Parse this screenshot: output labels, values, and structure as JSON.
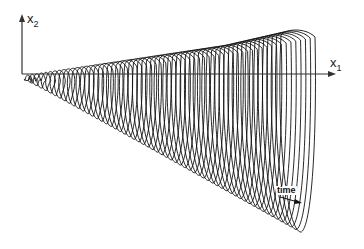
{
  "chart_data": {
    "type": "line",
    "title": "",
    "xlabel": "x1",
    "ylabel": "x2",
    "annotations": [
      {
        "text": "time",
        "arrow": "toward right/down along trajectory sweep"
      }
    ],
    "axes": {
      "origin_px": [
        22,
        74
      ],
      "x_axis_end_px": [
        330,
        74
      ],
      "y_axis_end_px": [
        22,
        16
      ]
    },
    "series": [
      {
        "name": "trajectory loops",
        "loop_count": 60,
        "crest_1_px": [
          248,
          34
        ],
        "crest_2_px": [
          318,
          34
        ],
        "lowest_point_px": [
          292,
          236
        ]
      }
    ],
    "grid": false,
    "legend": null
  },
  "labels": {
    "x_axis": {
      "base": "x",
      "sub": "1"
    },
    "y_axis": {
      "base": "x",
      "sub": "2"
    },
    "time": "time"
  },
  "colors": {
    "ink": "#111111",
    "axis": "#333333",
    "background": "#ffffff"
  }
}
